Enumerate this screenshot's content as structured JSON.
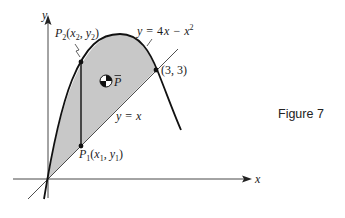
{
  "figure": {
    "caption": "Figure 7",
    "axes": {
      "x_label": "x",
      "y_label": "y"
    },
    "curves": [
      {
        "name": "parabola",
        "equation_label": "y = 4x − x²",
        "label_lhs": "y",
        "label_eq": "=",
        "label_rhs_a": "4",
        "label_rhs_x": "x",
        "label_minus": "−",
        "label_x2": "x",
        "label_exp": "2"
      },
      {
        "name": "line",
        "equation_label": "y = x",
        "label_lhs": "y",
        "label_eq": "=",
        "label_rhs": "x"
      }
    ],
    "points": {
      "intersection": {
        "label": "(3, 3)"
      },
      "p2": {
        "name": "P",
        "sub": "2",
        "open": "(",
        "x": "x",
        "xsub": "2",
        "comma": ", ",
        "y": "y",
        "ysub": "2",
        "close": ")"
      },
      "p1": {
        "name": "P",
        "sub": "1",
        "open": "(",
        "x": "x",
        "xsub": "1",
        "comma": ", ",
        "y": "y",
        "ysub": "1",
        "close": ")"
      },
      "centroid": {
        "label": "P",
        "bar": "‾"
      }
    },
    "colors": {
      "shade": "#c8c8c8",
      "curve": "#111111",
      "axis": "#333333",
      "background": "#ffffff"
    }
  }
}
